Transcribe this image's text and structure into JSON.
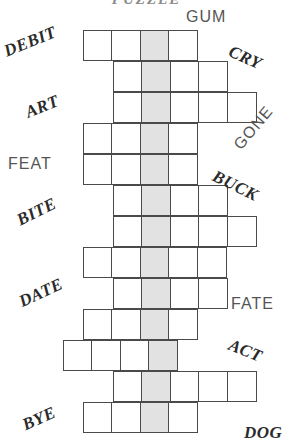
{
  "title_clipped": "PUZZLE",
  "grid": {
    "cell_size": 30,
    "row_height": 31,
    "shaded_color": "#e2e2e2",
    "cell_border_color": "#4a4a4a",
    "shaded_column_x": 143,
    "rows": [
      {
        "left": 83,
        "top": 30,
        "cells": 4,
        "shaded_index": 2
      },
      {
        "left": 113,
        "top": 61,
        "cells": 4,
        "shaded_index": 1
      },
      {
        "left": 113,
        "top": 92,
        "cells": 5,
        "shaded_index": 1
      },
      {
        "left": 83,
        "top": 123,
        "cells": 4,
        "shaded_index": 2
      },
      {
        "left": 83,
        "top": 154,
        "cells": 4,
        "shaded_index": 2
      },
      {
        "left": 113,
        "top": 185,
        "cells": 4,
        "shaded_index": 1
      },
      {
        "left": 113,
        "top": 216,
        "cells": 5,
        "shaded_index": 1
      },
      {
        "left": 83,
        "top": 247,
        "cells": 5,
        "shaded_index": 2
      },
      {
        "left": 113,
        "top": 278,
        "cells": 4,
        "shaded_index": 1
      },
      {
        "left": 83,
        "top": 309,
        "cells": 4,
        "shaded_index": 2
      },
      {
        "left": 63,
        "top": 340,
        "cells": 4,
        "shaded_index": 3
      },
      {
        "left": 113,
        "top": 371,
        "cells": 5,
        "shaded_index": 1
      },
      {
        "left": 83,
        "top": 402,
        "cells": 4,
        "shaded_index": 2
      }
    ]
  },
  "clues": [
    {
      "text": "GUM",
      "style": "light",
      "x": 186,
      "y": 8,
      "rotate": 0
    },
    {
      "text": "DEBIT",
      "style": "bold",
      "x": 3,
      "y": 32,
      "rotate": -22
    },
    {
      "text": "CRY",
      "style": "bold",
      "x": 228,
      "y": 48,
      "rotate": 24
    },
    {
      "text": "ART",
      "style": "bold",
      "x": 25,
      "y": 97,
      "rotate": -22
    },
    {
      "text": "GONE",
      "style": "light",
      "x": 228,
      "y": 119,
      "rotate": -50
    },
    {
      "text": "FEAT",
      "style": "light",
      "x": 8,
      "y": 155,
      "rotate": 0
    },
    {
      "text": "BUCK",
      "style": "bold",
      "x": 211,
      "y": 176,
      "rotate": 26
    },
    {
      "text": "BITE",
      "style": "bold",
      "x": 16,
      "y": 202,
      "rotate": -26
    },
    {
      "text": "DATE",
      "style": "bold",
      "x": 18,
      "y": 283,
      "rotate": -25
    },
    {
      "text": "FATE",
      "style": "light",
      "x": 231,
      "y": 295,
      "rotate": 0
    },
    {
      "text": "ACT",
      "style": "bold",
      "x": 228,
      "y": 341,
      "rotate": 22
    },
    {
      "text": "BYE",
      "style": "bold",
      "x": 22,
      "y": 409,
      "rotate": -24
    },
    {
      "text": "DOG",
      "style": "bold",
      "x": 244,
      "y": 423,
      "rotate": 0
    }
  ]
}
